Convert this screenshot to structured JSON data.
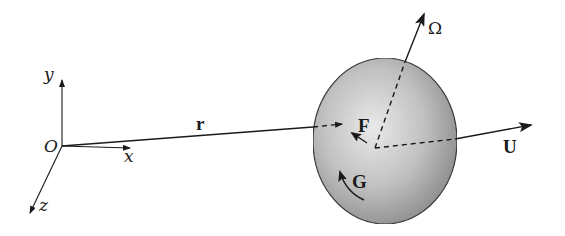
{
  "diagram": {
    "type": "vector-schematic",
    "coordinate_frame": {
      "origin_label": "O",
      "axes": [
        {
          "name": "x",
          "label": "x",
          "direction": "right"
        },
        {
          "name": "y",
          "label": "y",
          "direction": "up"
        },
        {
          "name": "z",
          "label": "z",
          "direction": "down-left (out of page)"
        }
      ]
    },
    "body": {
      "shape": "ellipsoid",
      "fill_light": "#e8e8e8",
      "fill_dark": "#8f8f8f",
      "outline": "#3a3a3a"
    },
    "vectors": [
      {
        "id": "r",
        "label": "r",
        "meaning": "position vector from O to body center",
        "style": "solid then dashed inside body"
      },
      {
        "id": "U",
        "label": "U",
        "meaning": "translational velocity",
        "style": "dashed inside body then solid"
      },
      {
        "id": "Omega",
        "label": "Ω",
        "meaning": "angular velocity",
        "style": "dashed inside body then solid"
      },
      {
        "id": "F",
        "label": "F",
        "meaning": "force",
        "style": "short arrow inside body"
      },
      {
        "id": "G",
        "label": "G",
        "meaning": "torque",
        "style": "curved arrow inside body"
      }
    ],
    "colors": {
      "ink": "#1a1a1a",
      "background": "#ffffff"
    }
  }
}
